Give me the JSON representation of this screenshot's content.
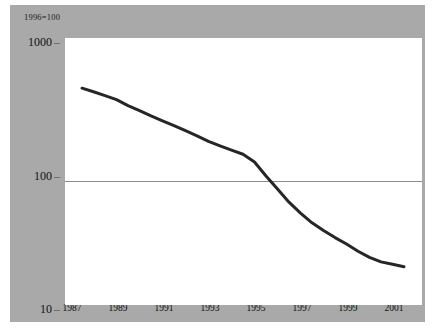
{
  "figure": {
    "index_note": "1996=100",
    "background_color": "#ffffff",
    "panel_color": "#a9a9a9",
    "plot_background_color": "#ffffff"
  },
  "chart_data": {
    "type": "line",
    "title": "",
    "subtitle": "",
    "xlabel": "",
    "ylabel": "",
    "annotations": [
      "1996=100"
    ],
    "yscale": "log",
    "ylim": [
      10,
      1000
    ],
    "ytick_labels": [
      "1000",
      "100",
      "10"
    ],
    "ytick_values": [
      1000,
      100,
      10
    ],
    "xlim": [
      1987,
      2001
    ],
    "xtick_labels": [
      "1987",
      "1989",
      "1991",
      "1993",
      "1995",
      "1997",
      "1999",
      "2001"
    ],
    "xtick_values": [
      1987,
      1989,
      1991,
      1993,
      1995,
      1997,
      1999,
      2001
    ],
    "grid": "horizontal-at-100",
    "gridline_values": [
      100
    ],
    "legend": "none",
    "series": [
      {
        "name": "index",
        "color": "#262626",
        "line_width": 3,
        "x": [
          1987,
          1987.5,
          1988,
          1988.5,
          1989,
          1989.5,
          1990,
          1990.5,
          1991,
          1991.5,
          1992,
          1992.5,
          1993,
          1993.5,
          1994,
          1994.5,
          1995,
          1995.5,
          1996,
          1996.5,
          1997,
          1997.5,
          1998,
          1998.5,
          1999,
          1999.5,
          2000,
          2000.5,
          2001
        ],
        "values": [
          500,
          470,
          440,
          410,
          370,
          340,
          310,
          285,
          262,
          240,
          220,
          200,
          185,
          172,
          160,
          140,
          110,
          88,
          70,
          58,
          49,
          43,
          38,
          34,
          30,
          27,
          25,
          24,
          23
        ]
      }
    ]
  }
}
